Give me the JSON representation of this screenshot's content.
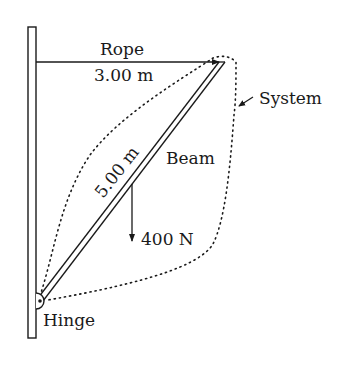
{
  "diagram": {
    "labels": {
      "rope": "Rope",
      "rope_length": "3.00 m",
      "system": "System",
      "beam": "Beam",
      "beam_length": "5.00 m",
      "weight": "400 N",
      "hinge": "Hinge"
    },
    "colors": {
      "ink": "#1a1a1a",
      "background": "#ffffff"
    }
  }
}
